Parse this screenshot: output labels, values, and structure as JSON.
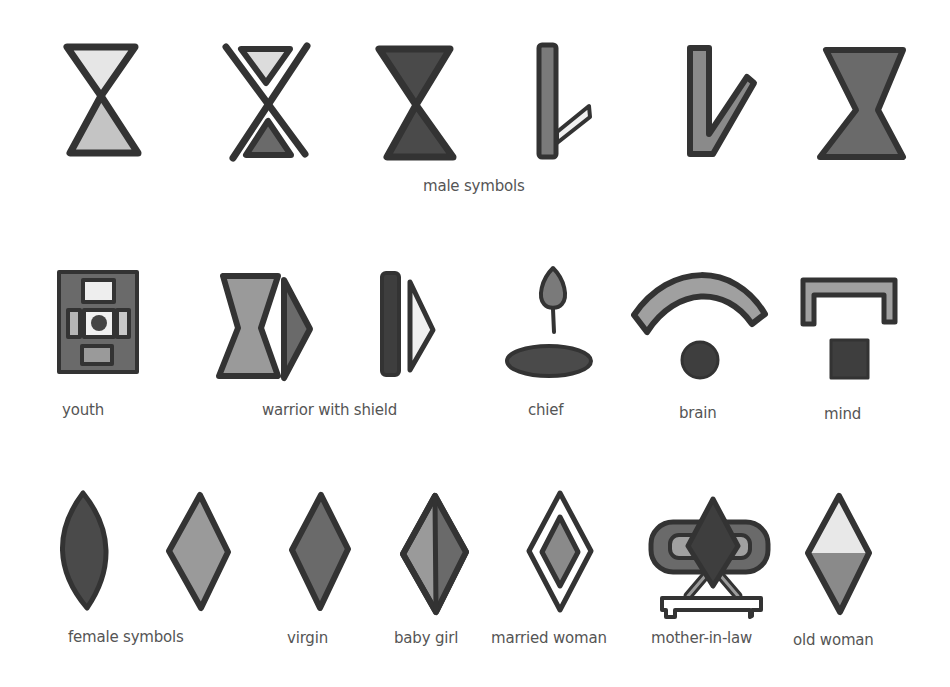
{
  "colors": {
    "outline": "#333333",
    "dark": "#4a4a4a",
    "mid": "#7a7a7a",
    "light": "#a8a8a8",
    "pale": "#e4e4e4",
    "white": "#ffffff",
    "text": "#555555"
  },
  "rows": [
    {
      "row": "male",
      "labels": [
        {
          "id": "male-symbols",
          "text": "male symbols"
        }
      ]
    },
    {
      "row": "roles",
      "labels": [
        {
          "id": "youth",
          "text": "youth"
        },
        {
          "id": "warrior-with-shield",
          "text": "warrior with shield"
        },
        {
          "id": "chief",
          "text": "chief"
        },
        {
          "id": "brain",
          "text": "brain"
        },
        {
          "id": "mind",
          "text": "mind"
        }
      ]
    },
    {
      "row": "female",
      "labels": [
        {
          "id": "female-symbols",
          "text": "female symbols"
        },
        {
          "id": "virgin",
          "text": "virgin"
        },
        {
          "id": "baby-girl",
          "text": "baby girl"
        },
        {
          "id": "married-woman",
          "text": "married woman"
        },
        {
          "id": "mother-in-law",
          "text": "mother-in-law"
        },
        {
          "id": "old-woman",
          "text": "old woman"
        }
      ]
    }
  ]
}
